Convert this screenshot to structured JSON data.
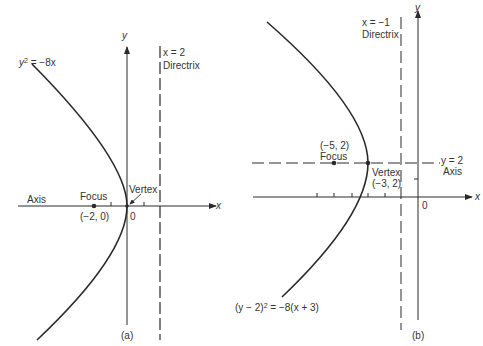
{
  "figure": {
    "panels": [
      {
        "id": "a",
        "caption": "(a)",
        "equation": {
          "lhs": "y",
          "exp": "2",
          "rhs": " = −8x"
        },
        "directrix": {
          "equation": "x = 2",
          "label": "Directrix"
        },
        "axis_label": "Axis",
        "focus": {
          "label": "Focus",
          "coords": "(−2, 0)"
        },
        "vertex": {
          "label": "Vertex"
        },
        "origin_label": "0",
        "x_axis_label": "x",
        "y_axis_label": "y"
      },
      {
        "id": "b",
        "caption": "(b)",
        "equation": {
          "lhs": "(y − 2)",
          "exp": "2",
          "rhs": " = −8(x + 3)"
        },
        "directrix": {
          "equation": "x = −1",
          "label": "Directrix"
        },
        "axis": {
          "equation": "y = 2",
          "label": "Axis"
        },
        "focus": {
          "label": "Focus",
          "coords": "(−5, 2)"
        },
        "vertex": {
          "label": "Vertex",
          "coords": "(−3, 2)"
        },
        "origin_label": "0",
        "x_axis_label": "x",
        "y_axis_label": "y"
      }
    ],
    "colors": {
      "line": "#2a2a2a",
      "background": "#ffffff"
    }
  }
}
